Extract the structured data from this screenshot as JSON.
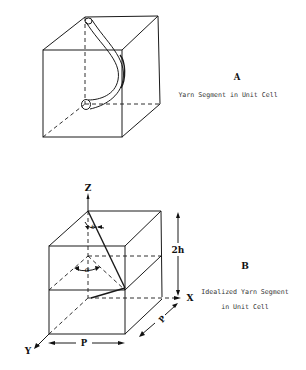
{
  "figure_a": {
    "label": "A",
    "caption": "Yarn Segment in Unit Cell"
  },
  "figure_b": {
    "label": "B",
    "caption_line1": "Idealized Yarn Segment",
    "caption_line2": "in Unit Cell",
    "axes": {
      "z": "Z",
      "x": "X",
      "y": "Y"
    },
    "dimensions": {
      "height": "2h",
      "width": "P",
      "depth": "P"
    },
    "angles": {
      "theta": "θ",
      "alpha": "α"
    }
  }
}
